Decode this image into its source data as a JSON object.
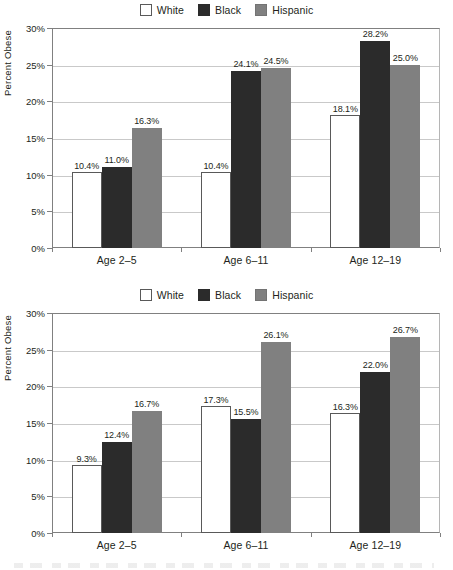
{
  "legend": {
    "items": [
      {
        "label": "White",
        "key": "white",
        "color": "#ffffff"
      },
      {
        "label": "Black",
        "key": "black",
        "color": "#2b2b2b"
      },
      {
        "label": "Hispanic",
        "key": "hispanic",
        "color": "#808080"
      }
    ]
  },
  "axis": {
    "ylabel": "Percent Obese",
    "yticks": [
      "0%",
      "5%",
      "10%",
      "15%",
      "20%",
      "25%",
      "30%"
    ],
    "ymin": 0,
    "ymax": 30
  },
  "charts": [
    {
      "id": "chart-top",
      "categories": [
        "Age 2–5",
        "Age 6–11",
        "Age 12–19"
      ],
      "bars": [
        [
          {
            "series": "White",
            "value": 10.4,
            "label": "10.4%"
          },
          {
            "series": "Black",
            "value": 11.0,
            "label": "11.0%"
          },
          {
            "series": "Hispanic",
            "value": 16.3,
            "label": "16.3%"
          }
        ],
        [
          {
            "series": "White",
            "value": 10.4,
            "label": "10.4%"
          },
          {
            "series": "Black",
            "value": 24.1,
            "label": "24.1%"
          },
          {
            "series": "Hispanic",
            "value": 24.5,
            "label": "24.5%"
          }
        ],
        [
          {
            "series": "White",
            "value": 18.1,
            "label": "18.1%"
          },
          {
            "series": "Black",
            "value": 28.2,
            "label": "28.2%"
          },
          {
            "series": "Hispanic",
            "value": 25.0,
            "label": "25.0%"
          }
        ]
      ]
    },
    {
      "id": "chart-bottom",
      "categories": [
        "Age 2–5",
        "Age 6–11",
        "Age 12–19"
      ],
      "bars": [
        [
          {
            "series": "White",
            "value": 9.3,
            "label": "9.3%"
          },
          {
            "series": "Black",
            "value": 12.4,
            "label": "12.4%"
          },
          {
            "series": "Hispanic",
            "value": 16.7,
            "label": "16.7%"
          }
        ],
        [
          {
            "series": "White",
            "value": 17.3,
            "label": "17.3%"
          },
          {
            "series": "Black",
            "value": 15.5,
            "label": "15.5%"
          },
          {
            "series": "Hispanic",
            "value": 26.1,
            "label": "26.1%"
          }
        ],
        [
          {
            "series": "White",
            "value": 16.3,
            "label": "16.3%"
          },
          {
            "series": "Black",
            "value": 22.0,
            "label": "22.0%"
          },
          {
            "series": "Hispanic",
            "value": 26.7,
            "label": "26.7%"
          }
        ]
      ]
    }
  ],
  "chart_data": [
    {
      "type": "bar",
      "title": "",
      "xlabel": "",
      "ylabel": "Percent Obese",
      "categories": [
        "Age 2–5",
        "Age 6–11",
        "Age 12–19"
      ],
      "series": [
        {
          "name": "White",
          "values": [
            10.4,
            10.4,
            18.1
          ]
        },
        {
          "name": "Black",
          "values": [
            11.0,
            24.1,
            28.2
          ]
        },
        {
          "name": "Hispanic",
          "values": [
            16.3,
            24.5,
            25.0
          ]
        }
      ],
      "ylim": [
        0,
        30
      ],
      "yticks": [
        0,
        5,
        10,
        15,
        20,
        25,
        30
      ],
      "ytick_labels": [
        "0%",
        "5%",
        "10%",
        "15%",
        "20%",
        "25%",
        "30%"
      ],
      "grid": "horizontal",
      "legend_position": "top-center",
      "data_labels": true,
      "units": "percent"
    },
    {
      "type": "bar",
      "title": "",
      "xlabel": "",
      "ylabel": "Percent Obese",
      "categories": [
        "Age 2–5",
        "Age 6–11",
        "Age 12–19"
      ],
      "series": [
        {
          "name": "White",
          "values": [
            9.3,
            17.3,
            16.3
          ]
        },
        {
          "name": "Black",
          "values": [
            12.4,
            15.5,
            22.0
          ]
        },
        {
          "name": "Hispanic",
          "values": [
            16.7,
            26.1,
            26.7
          ]
        }
      ],
      "ylim": [
        0,
        30
      ],
      "yticks": [
        0,
        5,
        10,
        15,
        20,
        25,
        30
      ],
      "ytick_labels": [
        "0%",
        "5%",
        "10%",
        "15%",
        "20%",
        "25%",
        "30%"
      ],
      "grid": "horizontal",
      "legend_position": "top-center",
      "data_labels": true,
      "units": "percent"
    }
  ]
}
